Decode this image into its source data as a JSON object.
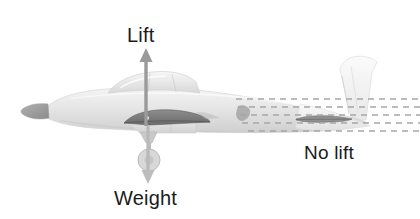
{
  "figure": {
    "title_visible": false,
    "background_color": "#ffffff"
  },
  "labels": {
    "lift": "Lift",
    "weight": "Weight",
    "no_lift": "No lift"
  },
  "arrows": {
    "lift": {
      "direction": "up",
      "color": "#9a9a9a",
      "origin_x": 146,
      "origin_y": 123,
      "tip_y": 49
    },
    "weight": {
      "direction": "down",
      "color": "#b4b4b4",
      "origin_x": 148,
      "origin_y": 126,
      "tip_y": 183
    }
  },
  "colors": {
    "text": "#1c1c1c",
    "fuselage_light": "#ececec",
    "fuselage_mid": "#dcdcdc",
    "fuselage_shade": "#cfcfcf",
    "canopy": "#e3e3e3",
    "wing_airfoil": "#8a8a8a",
    "wing_airfoil_dark": "#6e6e6e",
    "spinner": "#9e9e9e",
    "tail_light": "#f0f0f0",
    "flow_dash": "#a8a8a8",
    "arrow_gray": "#9a9a9a"
  },
  "icon_names": {
    "lift_arrow": "arrow-up-icon",
    "weight_arrow": "arrow-down-icon",
    "airflow": "dashed-flow-lines-icon",
    "wing": "cambered-airfoil-icon",
    "stabilizer": "symmetric-airfoil-icon"
  },
  "annotations": [
    {
      "name": "cambered-wing-generates-lift",
      "label": "Lift"
    },
    {
      "name": "aircraft-weight-downward",
      "label": "Weight"
    },
    {
      "name": "symmetric-tail-no-lift",
      "label": "No lift"
    }
  ],
  "airflow": {
    "rows": 5,
    "row_y": [
      99,
      107,
      115,
      123,
      131
    ],
    "dash_pattern": "6 5",
    "x_start": 236,
    "x_end": 420
  }
}
